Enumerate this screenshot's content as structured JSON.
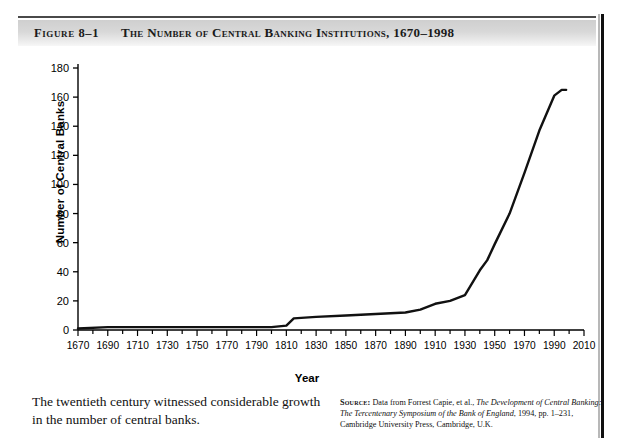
{
  "figure": {
    "label": "Figure 8–1",
    "title": "The Number of Central Banking Institutions, 1670–1998"
  },
  "caption": "The twentieth century witnessed considerable growth in the number of central banks.",
  "source": {
    "kicker": "Source:",
    "part1": " Data from Forrest Capie, et al., ",
    "italic1": "The Development of Central Banking: The Tercentenary Symposium of the Bank of England",
    "part2": ", 1994, pp. 1–231, Cambridge University Press, Cambridge, U.K."
  },
  "chart_data": {
    "type": "line",
    "title": "The Number of Central Banking Institutions, 1670–1998",
    "xlabel": "Year",
    "ylabel": "Number of Central Banks",
    "xlim": [
      1670,
      2010
    ],
    "ylim": [
      0,
      180
    ],
    "xticks": [
      1670,
      1690,
      1710,
      1730,
      1750,
      1770,
      1790,
      1810,
      1830,
      1850,
      1870,
      1890,
      1910,
      1930,
      1950,
      1970,
      1990,
      2010
    ],
    "yticks": [
      0,
      20,
      40,
      60,
      80,
      100,
      120,
      140,
      160,
      180
    ],
    "grid": false,
    "legend": null,
    "line_color": "#111111",
    "series": [
      {
        "name": "Number of central banks",
        "x": [
          1670,
          1690,
          1710,
          1730,
          1750,
          1770,
          1790,
          1800,
          1810,
          1815,
          1830,
          1850,
          1870,
          1890,
          1900,
          1910,
          1920,
          1930,
          1940,
          1945,
          1950,
          1960,
          1970,
          1980,
          1990,
          1995,
          1998
        ],
        "values": [
          1,
          2,
          2,
          2,
          2,
          2,
          2,
          2,
          3,
          8,
          9,
          10,
          11,
          12,
          14,
          18,
          20,
          24,
          41,
          48,
          59,
          80,
          108,
          137,
          161,
          165,
          165
        ]
      }
    ]
  }
}
